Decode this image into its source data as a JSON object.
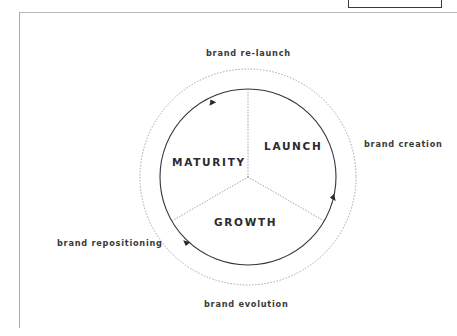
{
  "page": {
    "background_color": "#ffffff",
    "frame_color": "#b9b9bd"
  },
  "top_right_box": {
    "name": "clipped-box-fragment",
    "border_color": "#3a3a40",
    "label": ""
  },
  "diagram": {
    "type": "cycle-wheel",
    "center": {
      "x": 248,
      "y": 177
    },
    "inner_circle_radius": 88,
    "outer_circle_radius": 108,
    "inner_circle_color": "#33333a",
    "outer_circle_color": "#9a9aa2",
    "spoke_color": "#9a9aa2",
    "arrow_color": "#2b2b2f",
    "direction": "clockwise",
    "segments": [
      {
        "id": "launch",
        "label": "LAUNCH",
        "start_deg": 90,
        "end_deg": 330,
        "mid_deg": 30
      },
      {
        "id": "growth",
        "label": "GROWTH",
        "start_deg": 330,
        "end_deg": 210,
        "mid_deg": 270
      },
      {
        "id": "maturity",
        "label": "MATURITY",
        "start_deg": 210,
        "end_deg": 90,
        "mid_deg": 150
      }
    ],
    "spokes_deg": [
      90,
      210,
      330
    ],
    "arrows_deg": [
      115,
      341,
      228
    ],
    "outer_labels": [
      {
        "id": "brand-relaunch",
        "label": "brand re-launch",
        "position": "top"
      },
      {
        "id": "brand-creation",
        "label": "brand creation",
        "position": "right"
      },
      {
        "id": "brand-repositioning",
        "label": "brand repositioning",
        "position": "left"
      },
      {
        "id": "brand-evolution",
        "label": "brand evolution",
        "position": "bottom"
      }
    ]
  }
}
